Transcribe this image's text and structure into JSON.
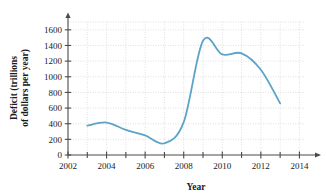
{
  "chart_data": {
    "type": "line",
    "title": "",
    "xlabel": "Year",
    "ylabel_line1": "Deficit (trillions",
    "ylabel_line2": "of dollars per year)",
    "xlim": [
      2002,
      2014.6
    ],
    "ylim": [
      0,
      1700
    ],
    "xticks_major": [
      2002,
      2004,
      2006,
      2008,
      2010,
      2012,
      2014
    ],
    "xticks_major_labels": [
      "2002",
      "2004",
      "2006",
      "2008",
      "2010",
      "2012",
      "2014"
    ],
    "xticks_minor": [
      2003,
      2005,
      2007,
      2009,
      2011,
      2013
    ],
    "yticks": [
      0,
      200,
      400,
      600,
      800,
      1000,
      1200,
      1400,
      1600
    ],
    "ytick_labels": [
      "0",
      "200",
      "400",
      "600",
      "800",
      "1000",
      "1200",
      "1400",
      "1600"
    ],
    "grid": true,
    "grid_style": "dotted",
    "grid_color": "#c8c8c8",
    "legend": "none",
    "line_color": "#5ba3c7",
    "line_width": 1.8,
    "axis_color": "#4a4a4a",
    "x": [
      2003,
      2004,
      2005,
      2006,
      2007,
      2008,
      2009,
      2010,
      2011,
      2012,
      2013
    ],
    "values": [
      375,
      415,
      320,
      250,
      150,
      420,
      1460,
      1285,
      1300,
      1090,
      660
    ],
    "series": [
      {
        "name": "Deficit",
        "values": [
          375,
          415,
          320,
          250,
          150,
          420,
          1460,
          1285,
          1300,
          1090,
          660
        ]
      }
    ]
  }
}
